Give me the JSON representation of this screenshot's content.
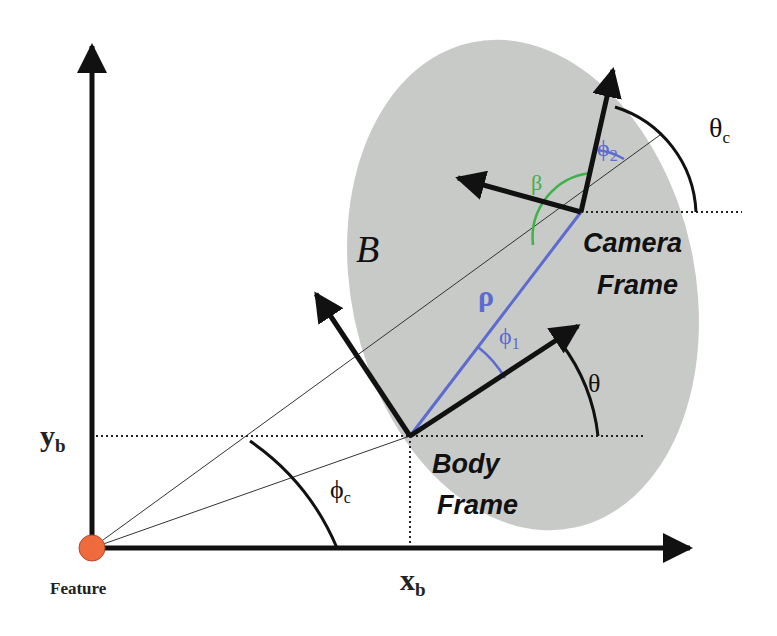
{
  "diagram": {
    "labels": {
      "feature": "Feature",
      "x_b": "x",
      "x_b_sub": "b",
      "y_b": "y",
      "y_b_sub": "b",
      "body_frame_line1": "Body",
      "body_frame_line2": "Frame",
      "camera_frame_line1": "Camera",
      "camera_frame_line2": "Frame",
      "body_set": "𝒮",
      "body_set_glyph": "B",
      "rho": "ρ",
      "phi_1": "ϕ",
      "phi_1_sub": "1",
      "phi_2": "ϕ",
      "phi_2_sub": "2",
      "phi_c": "ϕ",
      "phi_c_sub": "c",
      "theta": "θ",
      "theta_c": "θ",
      "theta_c_sub": "c",
      "beta": "β"
    },
    "colors": {
      "body_fill": "#c8cac8",
      "axis": "#111111",
      "rho_line": "#5b6bd0",
      "phi_arcs": "#5b6bd0",
      "beta_arc": "#3fb24a",
      "feature_point": "#ef6a3c",
      "feature_point_stroke": "#b44a25"
    },
    "points": {
      "feature_origin": [
        92,
        548
      ],
      "body_frame_origin": [
        410,
        436
      ],
      "camera_frame_origin": [
        581,
        212
      ]
    }
  }
}
